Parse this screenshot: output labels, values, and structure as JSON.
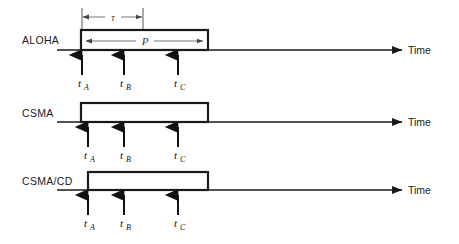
{
  "figure": {
    "type": "timing-diagram",
    "background": "#ffffff",
    "line_color": "#1a1a1a",
    "width": 459,
    "height": 244
  },
  "axis": {
    "time_label": "Time",
    "arrow_x_start": 57,
    "arrow_x_end": 402
  },
  "annotations": {
    "tau_symbol": "τ",
    "p_symbol": "P",
    "t_symbol": "t",
    "sub_a": "A",
    "sub_b": "B",
    "sub_c": "C"
  },
  "rows": [
    {
      "name": "aloha",
      "label": "ALOHA",
      "baseline_y": 50,
      "label_x": 22,
      "label_y": 44,
      "packet": {
        "x1": 81,
        "x2": 208,
        "top_y": 30,
        "bottom_y": 50
      },
      "has_p_arrow": true,
      "p_arrow": {
        "x1": 85,
        "x2": 204,
        "y": 41
      },
      "has_tau": true,
      "tau": {
        "x1": 82,
        "x2": 143,
        "y": 17,
        "tick_top": 8,
        "tick_bottom": 30
      },
      "events": [
        {
          "label": "t",
          "sub": "A",
          "x": 82,
          "arrow_top": 55,
          "arrow_bottom": 75,
          "text_y": 87
        },
        {
          "label": "t",
          "sub": "B",
          "x": 124,
          "arrow_top": 55,
          "arrow_bottom": 75,
          "text_y": 87
        },
        {
          "label": "t",
          "sub": "C",
          "x": 178,
          "arrow_top": 55,
          "arrow_bottom": 75,
          "text_y": 87
        }
      ]
    },
    {
      "name": "csma",
      "label": "CSMA",
      "baseline_y": 122,
      "label_x": 22,
      "label_y": 117,
      "packet": {
        "x1": 81,
        "x2": 208,
        "top_y": 103,
        "bottom_y": 122
      },
      "has_p_arrow": false,
      "has_tau": false,
      "events": [
        {
          "label": "t",
          "sub": "A",
          "x": 88,
          "arrow_top": 127,
          "arrow_bottom": 147,
          "text_y": 159
        },
        {
          "label": "t",
          "sub": "B",
          "x": 124,
          "arrow_top": 127,
          "arrow_bottom": 147,
          "text_y": 159
        },
        {
          "label": "t",
          "sub": "C",
          "x": 178,
          "arrow_top": 127,
          "arrow_bottom": 147,
          "text_y": 159
        }
      ]
    },
    {
      "name": "csma-cd",
      "label": "CSMA/CD",
      "baseline_y": 190,
      "label_x": 22,
      "label_y": 185,
      "packet": {
        "x1": 88,
        "x2": 208,
        "top_y": 172,
        "bottom_y": 190
      },
      "has_p_arrow": false,
      "has_tau": false,
      "events": [
        {
          "label": "t",
          "sub": "A",
          "x": 88,
          "arrow_top": 195,
          "arrow_bottom": 215,
          "text_y": 227
        },
        {
          "label": "t",
          "sub": "B",
          "x": 124,
          "arrow_top": 195,
          "arrow_bottom": 215,
          "text_y": 227
        },
        {
          "label": "t",
          "sub": "C",
          "x": 178,
          "arrow_top": 195,
          "arrow_bottom": 215,
          "text_y": 227
        }
      ]
    }
  ]
}
